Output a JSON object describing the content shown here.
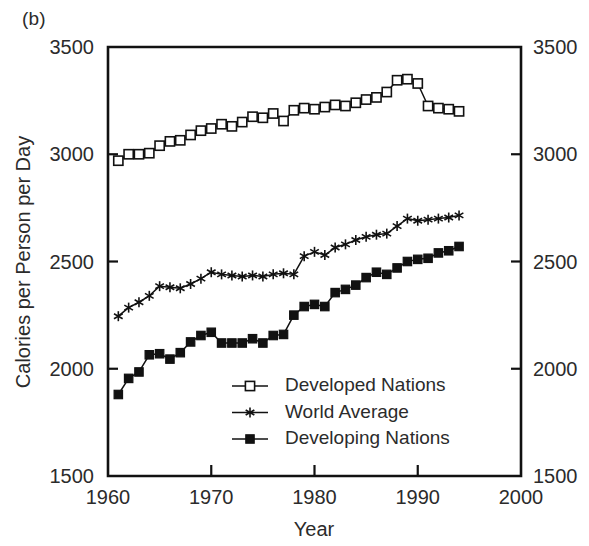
{
  "panel": {
    "label": "(b)"
  },
  "chart_data": {
    "type": "line",
    "title": "",
    "subtitle": "",
    "xlabel": "Year",
    "ylabel": "Calories per Person per Day",
    "ylabel_right": "Calories per Person per Day",
    "xlim": [
      1960,
      2000
    ],
    "ylim": [
      1500,
      3500
    ],
    "xticks": [
      1960,
      1970,
      1980,
      1990,
      2000
    ],
    "xticklabels": [
      "1960",
      "1970",
      "1980",
      "1990",
      "2000"
    ],
    "yticks": [
      1500,
      2000,
      2500,
      3000,
      3500
    ],
    "yticklabels": [
      "1500",
      "2000",
      "2500",
      "3000",
      "3500"
    ],
    "yticklabels_right": [
      "1500",
      "2000",
      "2500",
      "3000",
      "3500"
    ],
    "grid": false,
    "legend_position": "center-bottom-inside",
    "axis_color": "#111111",
    "series": [
      {
        "name": "Developed Nations",
        "marker": "open-square",
        "color": "#111111",
        "x": [
          1961,
          1962,
          1963,
          1964,
          1965,
          1966,
          1967,
          1968,
          1969,
          1970,
          1971,
          1972,
          1973,
          1974,
          1975,
          1976,
          1977,
          1978,
          1979,
          1980,
          1981,
          1982,
          1983,
          1984,
          1985,
          1986,
          1987,
          1988,
          1989,
          1990,
          1991,
          1992,
          1993,
          1994
        ],
        "values": [
          2970,
          3000,
          3000,
          3005,
          3040,
          3060,
          3065,
          3090,
          3110,
          3120,
          3140,
          3130,
          3150,
          3175,
          3170,
          3190,
          3155,
          3205,
          3215,
          3210,
          3220,
          3230,
          3225,
          3240,
          3255,
          3265,
          3290,
          3345,
          3350,
          3330,
          3225,
          3215,
          3210,
          3200
        ]
      },
      {
        "name": "World Average",
        "marker": "star",
        "color": "#111111",
        "x": [
          1961,
          1962,
          1963,
          1964,
          1965,
          1966,
          1967,
          1968,
          1969,
          1970,
          1971,
          1972,
          1973,
          1974,
          1975,
          1976,
          1977,
          1978,
          1979,
          1980,
          1981,
          1982,
          1983,
          1984,
          1985,
          1986,
          1987,
          1988,
          1989,
          1990,
          1991,
          1992,
          1993,
          1994
        ],
        "values": [
          2245,
          2285,
          2310,
          2340,
          2385,
          2380,
          2375,
          2395,
          2420,
          2450,
          2440,
          2435,
          2430,
          2435,
          2430,
          2440,
          2445,
          2440,
          2525,
          2545,
          2530,
          2565,
          2580,
          2600,
          2615,
          2625,
          2630,
          2665,
          2700,
          2690,
          2695,
          2700,
          2705,
          2715
        ]
      },
      {
        "name": "Developing Nations",
        "marker": "filled-square",
        "color": "#111111",
        "x": [
          1961,
          1962,
          1963,
          1964,
          1965,
          1966,
          1967,
          1968,
          1969,
          1970,
          1971,
          1972,
          1973,
          1974,
          1975,
          1976,
          1977,
          1978,
          1979,
          1980,
          1981,
          1982,
          1983,
          1984,
          1985,
          1986,
          1987,
          1988,
          1989,
          1990,
          1991,
          1992,
          1993,
          1994
        ],
        "values": [
          1880,
          1955,
          1985,
          2065,
          2070,
          2045,
          2075,
          2125,
          2155,
          2170,
          2120,
          2120,
          2120,
          2140,
          2120,
          2155,
          2160,
          2250,
          2290,
          2300,
          2290,
          2355,
          2370,
          2390,
          2425,
          2450,
          2440,
          2470,
          2500,
          2510,
          2515,
          2540,
          2550,
          2570
        ]
      }
    ],
    "legend": [
      {
        "label": "Developed Nations",
        "marker": "open-square"
      },
      {
        "label": "World Average",
        "marker": "star"
      },
      {
        "label": "Developing Nations",
        "marker": "filled-square"
      }
    ]
  }
}
